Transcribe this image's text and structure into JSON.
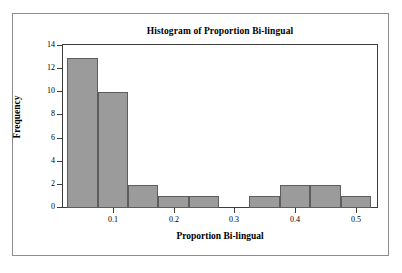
{
  "figure": {
    "background_color": "#ffffff",
    "frame_color": "#8d8d8d",
    "axis_color": "#3c3c3c",
    "bar_fill_color": "#9b9b9b",
    "bar_edge_color": "#5d5d5d"
  },
  "chart_data": {
    "type": "bar",
    "title": "Histogram of Proportion Bi-lingual",
    "xlabel": "Proportion Bi-lingual",
    "ylabel": "Frequency",
    "xlim": [
      0.018,
      0.535
    ],
    "ylim": [
      0,
      14
    ],
    "grid": false,
    "legend": "none",
    "bin_width": 0.025,
    "bin_edges": [
      0.025,
      0.05,
      0.075,
      0.1,
      0.125,
      0.15,
      0.175,
      0.2,
      0.225,
      0.25,
      0.275,
      0.3,
      0.325,
      0.35,
      0.375,
      0.4,
      0.425,
      0.45,
      0.475,
      0.5,
      0.525
    ],
    "categories": [
      "0.025-0.05",
      "0.05-0.075",
      "0.075-0.10",
      "0.10-0.125",
      "0.125-0.15",
      "0.15-0.175",
      "0.175-0.20",
      "0.20-0.225",
      "0.225-0.25",
      "0.25-0.275",
      "0.275-0.30",
      "0.30-0.325",
      "0.325-0.35",
      "0.35-0.375",
      "0.375-0.40",
      "0.40-0.425",
      "0.425-0.45",
      "0.45-0.475",
      "0.475-0.50",
      "0.50-0.525"
    ],
    "values": [
      13,
      13,
      10,
      10,
      2,
      2,
      1,
      1,
      1,
      1,
      0,
      0,
      1,
      1,
      2,
      2,
      2,
      2,
      1,
      1
    ],
    "bars": [
      {
        "x0": 0.025,
        "x1": 0.075,
        "value": 13
      },
      {
        "x0": 0.075,
        "x1": 0.125,
        "value": 10
      },
      {
        "x0": 0.125,
        "x1": 0.175,
        "value": 2
      },
      {
        "x0": 0.175,
        "x1": 0.225,
        "value": 1
      },
      {
        "x0": 0.225,
        "x1": 0.275,
        "value": 1
      },
      {
        "x0": 0.275,
        "x1": 0.325,
        "value": 0
      },
      {
        "x0": 0.325,
        "x1": 0.375,
        "value": 1
      },
      {
        "x0": 0.375,
        "x1": 0.425,
        "value": 2
      },
      {
        "x0": 0.425,
        "x1": 0.475,
        "value": 2
      },
      {
        "x0": 0.475,
        "x1": 0.525,
        "value": 1
      }
    ],
    "xticks": [
      0.1,
      0.2,
      0.3,
      0.4,
      0.5
    ],
    "xticklabels": [
      "0.1",
      "0.2",
      "0.3",
      "0.4",
      "0.5"
    ],
    "yticks": [
      0,
      2,
      4,
      6,
      8,
      10,
      12,
      14
    ],
    "yticklabels": [
      "0",
      "2",
      "4",
      "6",
      "8",
      "10",
      "12",
      "14"
    ]
  }
}
